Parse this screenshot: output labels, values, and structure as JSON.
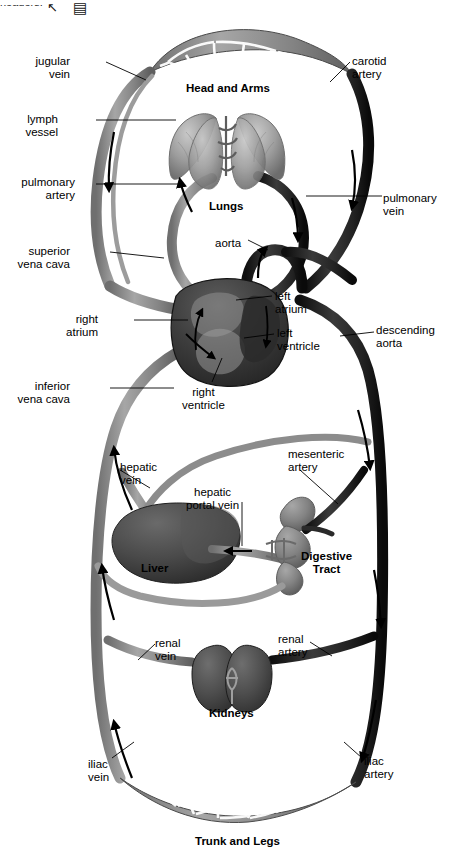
{
  "topbar": {
    "cropped_text": "headers:",
    "icons": [
      {
        "name": "cursor-arrow-icon",
        "glyph": "↖"
      },
      {
        "name": "book-icon",
        "glyph": "▤"
      }
    ]
  },
  "diagram": {
    "colors": {
      "vein": "#8a8a8a",
      "artery": "#1c1c1c",
      "organ_dark": "#3f3f3f",
      "organ_mid": "#6e6e6e",
      "organ_light": "#9a9a9a",
      "background": "#ffffff",
      "leader_line": "#000000"
    },
    "region_labels": [
      {
        "name": "head-and-arms-label",
        "text": "Head and Arms",
        "x": 186,
        "y": 82
      },
      {
        "name": "lungs-label",
        "text": "Lungs",
        "x": 209,
        "y": 200
      },
      {
        "name": "liver-label",
        "text": "Liver",
        "x": 141,
        "y": 562
      },
      {
        "name": "digestive-tract-label",
        "text": "Digestive\nTract",
        "x": 301,
        "y": 550
      },
      {
        "name": "kidneys-label",
        "text": "Kidneys",
        "x": 209,
        "y": 707
      },
      {
        "name": "trunk-and-legs-label",
        "text": "Trunk and Legs",
        "x": 195,
        "y": 835
      }
    ],
    "callouts": [
      {
        "name": "jugular-vein-label",
        "text": "jugular\nvein",
        "align": "right",
        "x": 70,
        "y": 55
      },
      {
        "name": "carotid-artery-label",
        "text": "carotid\nartery",
        "align": "left",
        "x": 352,
        "y": 55
      },
      {
        "name": "lymph-vessel-label",
        "text": "lymph\nvessel",
        "align": "right",
        "x": 58,
        "y": 113
      },
      {
        "name": "pulmonary-artery-label",
        "text": "pulmonary\nartery",
        "align": "right",
        "x": 75,
        "y": 176
      },
      {
        "name": "pulmonary-vein-label",
        "text": "pulmonary\nvein",
        "align": "left",
        "x": 383,
        "y": 192
      },
      {
        "name": "superior-vena-cava-label",
        "text": "superior\nvena cava",
        "align": "right",
        "x": 70,
        "y": 245
      },
      {
        "name": "aorta-label",
        "text": "aorta",
        "align": "left",
        "x": 215,
        "y": 237
      },
      {
        "name": "left-atrium-label",
        "text": "left\natrium",
        "align": "left",
        "x": 275,
        "y": 290
      },
      {
        "name": "right-atrium-label",
        "text": "right\natrium",
        "align": "right",
        "x": 98,
        "y": 313
      },
      {
        "name": "left-ventricle-label",
        "text": "left\nventricle",
        "align": "left",
        "x": 277,
        "y": 327
      },
      {
        "name": "descending-aorta-label",
        "text": "descending\naorta",
        "align": "left",
        "x": 376,
        "y": 324
      },
      {
        "name": "inferior-vena-cava-label",
        "text": "inferior\nvena cava",
        "align": "right",
        "x": 70,
        "y": 380
      },
      {
        "name": "right-ventricle-label",
        "text": "right\nventricle",
        "align": "left",
        "x": 186,
        "y": 386
      },
      {
        "name": "hepatic-vein-label",
        "text": "hepatic\nvein",
        "align": "left",
        "x": 120,
        "y": 461
      },
      {
        "name": "mesenteric-artery-label",
        "text": "mesenteric\nartery",
        "align": "left",
        "x": 288,
        "y": 448
      },
      {
        "name": "hepatic-portal-vein-label",
        "text": "hepatic\nportal vein",
        "align": "left",
        "x": 190,
        "y": 486
      },
      {
        "name": "renal-vein-label",
        "text": "renal\nvein",
        "align": "left",
        "x": 155,
        "y": 637
      },
      {
        "name": "renal-artery-label",
        "text": "renal\nartery",
        "align": "left",
        "x": 278,
        "y": 633
      },
      {
        "name": "iliac-vein-label",
        "text": "iliac\nvein",
        "align": "left",
        "x": 88,
        "y": 758
      },
      {
        "name": "iliac-artery-label",
        "text": "iliac\nartery",
        "align": "left",
        "x": 364,
        "y": 755
      }
    ]
  }
}
